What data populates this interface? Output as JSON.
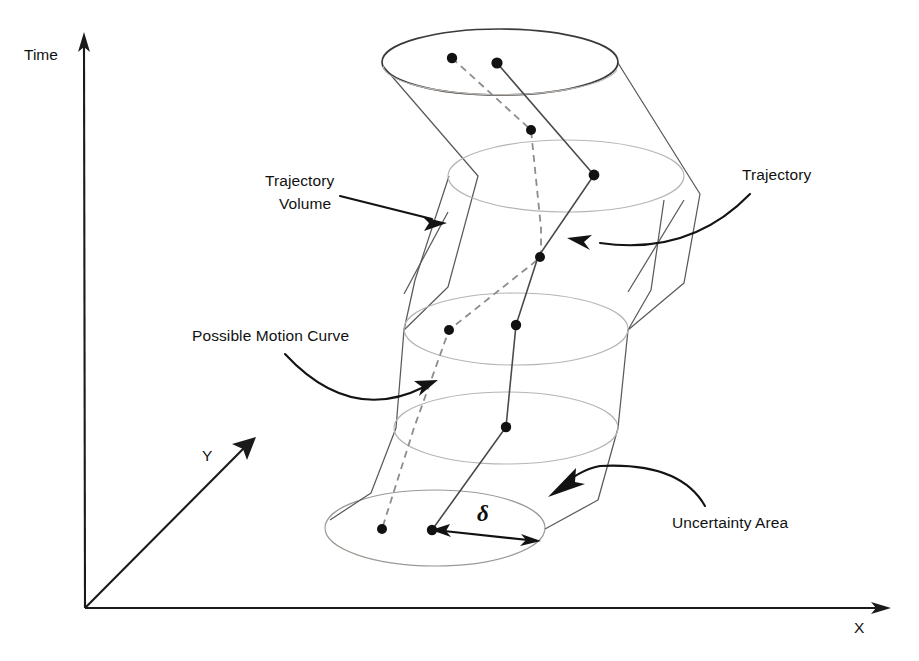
{
  "figure": {
    "title_strip": "",
    "background": "#ffffff",
    "width": 919,
    "height": 661
  },
  "axes": {
    "time_label": "Time",
    "x_label": "X",
    "y_label": "Y",
    "origin": [
      85,
      608
    ],
    "time_tip": [
      84,
      36
    ],
    "x_tip": [
      891,
      608
    ],
    "y_tip": [
      255,
      437
    ],
    "color": "#1a1a1a"
  },
  "annotations": [
    {
      "id": "trajectory-volume",
      "line1": "Trajectory",
      "line2": "Volume",
      "text_x": 265,
      "text_y": 186,
      "points_to": "tube-left-wall"
    },
    {
      "id": "possible-motion-curve",
      "line1": "Possible Motion Curve",
      "line2": "",
      "text_x": 192,
      "text_y": 341,
      "points_to": "dashed-curve"
    },
    {
      "id": "trajectory",
      "line1": "Trajectory",
      "line2": "",
      "text_x": 742,
      "text_y": 180,
      "points_to": "solid-curve"
    },
    {
      "id": "uncertainty-area",
      "line1": "Uncertainty Area",
      "line2": "",
      "text_x": 672,
      "text_y": 528,
      "points_to": "bottom-disc"
    }
  ],
  "delta": {
    "symbol": "δ",
    "label_x": 483,
    "label_y": 521,
    "arrow_from": [
      432,
      530
    ],
    "arrow_to": [
      540,
      540
    ],
    "meaning": "uncertainty radius"
  },
  "tube": {
    "name": "trajectory-volume-tube",
    "fill_rings": 5,
    "ring_stroke": "#b9b4b0",
    "wall_stroke": "#5a5a5a",
    "rings": [
      {
        "cx": 500,
        "cy": 62,
        "rx": 118,
        "ry": 33,
        "style": "top-dark"
      },
      {
        "cx": 500,
        "cy": 88,
        "rx": 118,
        "ry": 33,
        "style": "faint"
      },
      {
        "cx": 566,
        "cy": 176,
        "rx": 118,
        "ry": 36,
        "style": "faint"
      },
      {
        "cx": 516,
        "cy": 329,
        "rx": 112,
        "ry": 36,
        "style": "faint"
      },
      {
        "cx": 506,
        "cy": 428,
        "rx": 112,
        "ry": 36,
        "style": "faint"
      },
      {
        "cx": 435,
        "cy": 528,
        "rx": 110,
        "ry": 38,
        "style": "shaded"
      }
    ]
  },
  "uncertainty_disc": {
    "cx": 435,
    "cy": 528,
    "rx": 110,
    "ry": 38,
    "fill": "#dedede",
    "stroke": "#9c9894"
  },
  "curves": {
    "solid": {
      "name": "trajectory",
      "stroke": "#4a4a4a",
      "dash": "none",
      "points": [
        [
          497,
          63
        ],
        [
          594,
          175
        ],
        [
          538,
          257
        ],
        [
          516,
          325
        ],
        [
          506,
          427
        ],
        [
          432,
          530
        ]
      ]
    },
    "dashed": {
      "name": "possible-motion-curve",
      "stroke": "#8c8c8c",
      "dash": "7 5",
      "points": [
        [
          452,
          58
        ],
        [
          531,
          130
        ],
        [
          541,
          228
        ],
        [
          449,
          330
        ],
        [
          414,
          428
        ],
        [
          382,
          529
        ]
      ]
    }
  },
  "nodes": [
    {
      "cx": 452,
      "cy": 58,
      "r": 5.2,
      "on": "dashed"
    },
    {
      "cx": 497,
      "cy": 63,
      "r": 5.6,
      "on": "solid"
    },
    {
      "cx": 531,
      "cy": 130,
      "r": 5.0,
      "on": "dashed"
    },
    {
      "cx": 594,
      "cy": 175,
      "r": 5.4,
      "on": "solid"
    },
    {
      "cx": 541,
      "cy": 257,
      "r": 5.0,
      "on": "dashed"
    },
    {
      "cx": 449,
      "cy": 330,
      "r": 5.0,
      "on": "dashed"
    },
    {
      "cx": 516,
      "cy": 325,
      "r": 5.2,
      "on": "solid"
    },
    {
      "cx": 506,
      "cy": 427,
      "r": 5.2,
      "on": "solid"
    },
    {
      "cx": 382,
      "cy": 529,
      "r": 5.0,
      "on": "dashed"
    },
    {
      "cx": 432,
      "cy": 530,
      "r": 5.2,
      "on": "solid"
    }
  ]
}
